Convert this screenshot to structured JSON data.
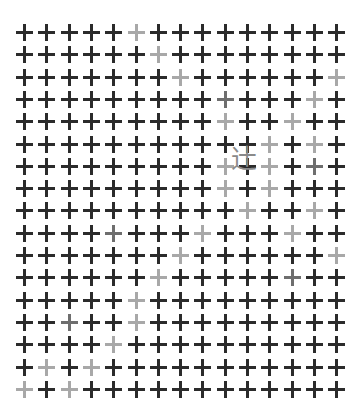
{
  "stimulus": {
    "name": "cross-array-visual-search",
    "background_color": "#ffffff",
    "canvas_width": 359,
    "canvas_height": 418,
    "grid": {
      "columns": 15,
      "rows": 17,
      "origin_x": 16,
      "origin_y": 24,
      "step_x": 22.3,
      "step_y": 22.3,
      "cell_size": 17
    },
    "cross": {
      "glyph": "+",
      "arm_thickness": 3,
      "arm_length": 17,
      "color_dark": "#2b2b2b",
      "color_light": "#a8a8a8",
      "color_mid": "#6e6e6e"
    },
    "target": {
      "character": "辻",
      "label": "kanji-tsuji-crossroads",
      "color": "#8a8a8a",
      "font_size": 26,
      "x": 231,
      "y": 146
    },
    "light_cells": [
      [
        0,
        5
      ],
      [
        1,
        6
      ],
      [
        2,
        7
      ],
      [
        2,
        14
      ],
      [
        3,
        13
      ],
      [
        4,
        9
      ],
      [
        4,
        12
      ],
      [
        5,
        11
      ],
      [
        5,
        13
      ],
      [
        6,
        9
      ],
      [
        6,
        11
      ],
      [
        7,
        9
      ],
      [
        7,
        11
      ],
      [
        8,
        10
      ],
      [
        8,
        13
      ],
      [
        9,
        8
      ],
      [
        9,
        12
      ],
      [
        10,
        7
      ],
      [
        10,
        14
      ],
      [
        11,
        6
      ],
      [
        12,
        5
      ],
      [
        13,
        5
      ],
      [
        14,
        4
      ],
      [
        15,
        3
      ],
      [
        15,
        1
      ],
      [
        16,
        0
      ],
      [
        16,
        2
      ]
    ],
    "mid_cells": [
      [
        3,
        9
      ],
      [
        6,
        13
      ],
      [
        9,
        4
      ],
      [
        11,
        12
      ],
      [
        13,
        2
      ]
    ]
  }
}
